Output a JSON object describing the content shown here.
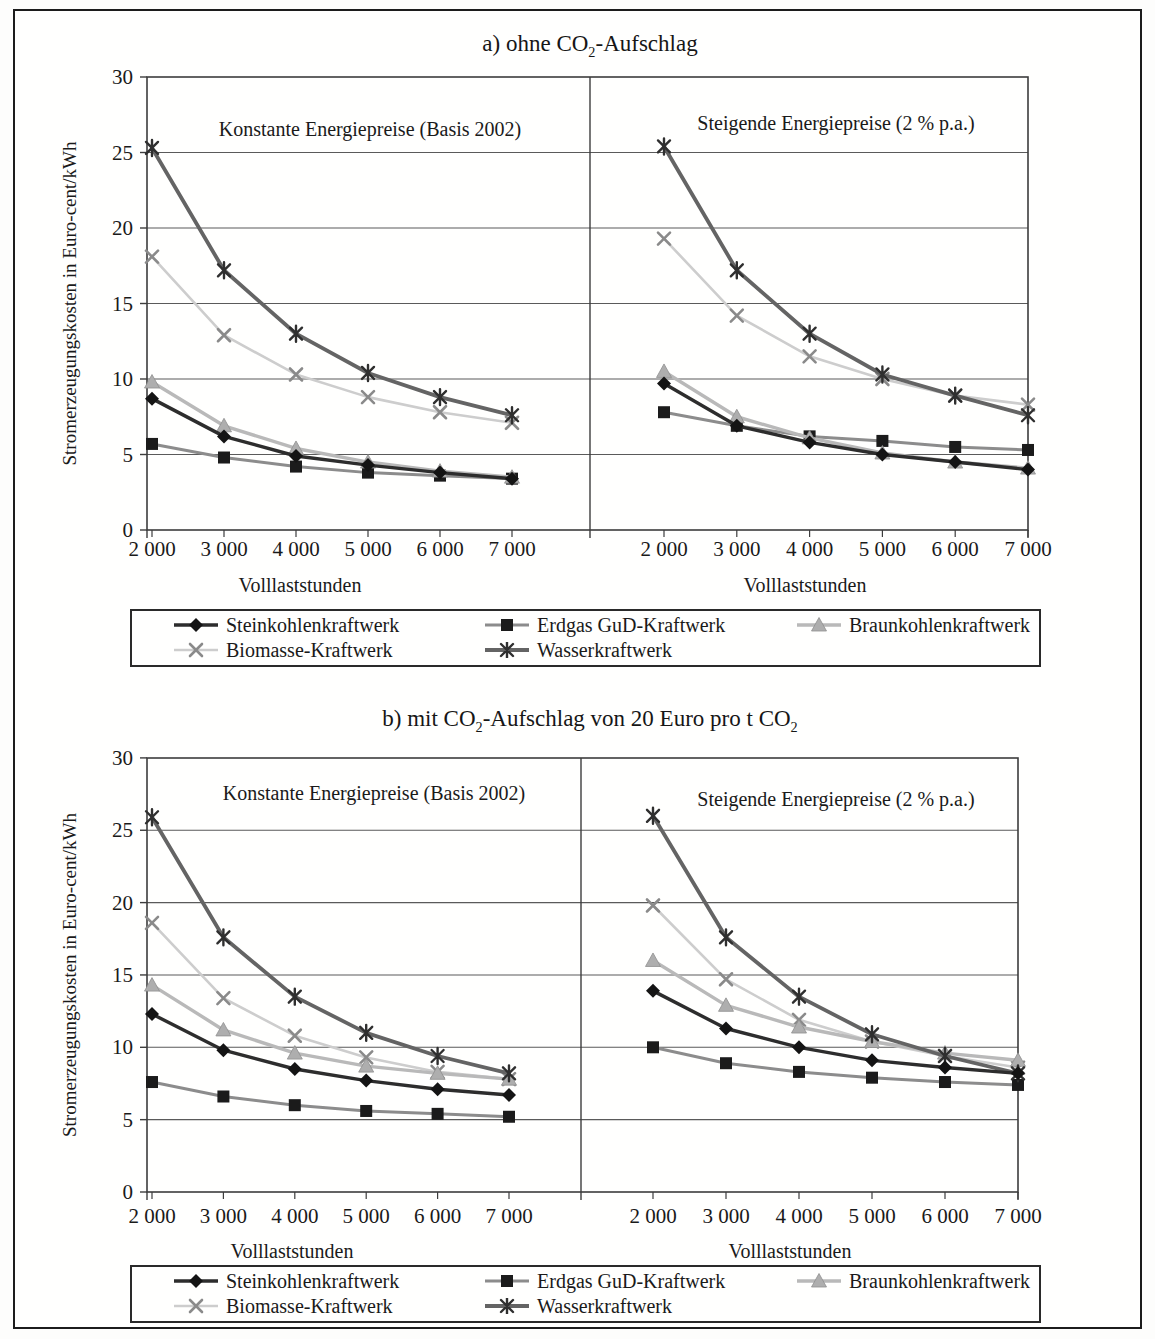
{
  "figure": {
    "background": "#fdfdfc",
    "border_color": "#1c1c1c",
    "grid_color": "#5a5a5a",
    "frame_color": "#3d3d3d",
    "text_color": "#1a1a1a"
  },
  "axes": {
    "ylabel": "Stromerzeugungskosten in Euro-cent/kWh",
    "xlabel": "Volllaststunden",
    "ylim": [
      0,
      30
    ],
    "yticks": [
      0,
      5,
      10,
      15,
      20,
      25,
      30
    ],
    "x": [
      2000,
      3000,
      4000,
      5000,
      6000,
      7000
    ],
    "x_tick_labels": [
      "2 000",
      "3 000",
      "4 000",
      "5 000",
      "6 000",
      "7 000"
    ],
    "grid": "horizontal"
  },
  "series_styles": [
    {
      "name": "Steinkohlenkraftwerk",
      "marker": "diamond",
      "line_color": "#2d2d2d",
      "marker_color": "#141414",
      "line_width": 3.4
    },
    {
      "name": "Erdgas GuD-Kraftwerk",
      "marker": "square",
      "line_color": "#8c8c8c",
      "marker_color": "#1b1b1b",
      "line_width": 3.0
    },
    {
      "name": "Braunkohlenkraftwerk",
      "marker": "triangle",
      "line_color": "#b9b9b9",
      "marker_color": "#aeaeae",
      "line_width": 3.4
    },
    {
      "name": "Biomasse-Kraftwerk",
      "marker": "x",
      "line_color": "#cdcdcd",
      "marker_color": "#8a8a8a",
      "line_width": 2.6
    },
    {
      "name": "Wasserkraftwerk",
      "marker": "asterisk",
      "line_color": "#646464",
      "marker_color": "#2f2f2f",
      "line_width": 3.8
    }
  ],
  "chart_data": [
    {
      "type": "line",
      "panel": "a",
      "title": "a) ohne CO₂-Aufschlag",
      "title_parts": [
        {
          "text": "a) ohne CO"
        },
        {
          "text": "2",
          "sub": true
        },
        {
          "text": "-Aufschlag"
        }
      ],
      "ylabel": "Stromerzeugungskosten in Euro-cent/kWh",
      "xlabel": "Volllaststunden",
      "x": [
        2000,
        3000,
        4000,
        5000,
        6000,
        7000
      ],
      "subcharts": [
        {
          "label": "Konstante Energiepreise (Basis 2002)",
          "series": [
            {
              "name": "Steinkohlenkraftwerk",
              "values": [
                8.7,
                6.2,
                4.9,
                4.3,
                3.8,
                3.4
              ]
            },
            {
              "name": "Erdgas GuD-Kraftwerk",
              "values": [
                5.7,
                4.8,
                4.2,
                3.8,
                3.6,
                3.4
              ]
            },
            {
              "name": "Braunkohlenkraftwerk",
              "values": [
                9.8,
                6.9,
                5.4,
                4.5,
                3.9,
                3.5
              ]
            },
            {
              "name": "Biomasse-Kraftwerk",
              "values": [
                18.1,
                12.9,
                10.3,
                8.8,
                7.8,
                7.1
              ]
            },
            {
              "name": "Wasserkraftwerk",
              "values": [
                25.3,
                17.2,
                13.0,
                10.4,
                8.8,
                7.6
              ]
            }
          ]
        },
        {
          "label": "Steigende Energiepreise (2 % p.a.)",
          "series": [
            {
              "name": "Steinkohlenkraftwerk",
              "values": [
                9.7,
                6.9,
                5.8,
                5.0,
                4.5,
                4.0
              ]
            },
            {
              "name": "Erdgas GuD-Kraftwerk",
              "values": [
                7.8,
                6.9,
                6.2,
                5.9,
                5.5,
                5.3
              ]
            },
            {
              "name": "Braunkohlenkraftwerk",
              "values": [
                10.5,
                7.5,
                6.1,
                5.1,
                4.5,
                4.1
              ]
            },
            {
              "name": "Biomasse-Kraftwerk",
              "values": [
                19.3,
                14.2,
                11.5,
                10.0,
                8.9,
                8.3
              ]
            },
            {
              "name": "Wasserkraftwerk",
              "values": [
                25.4,
                17.2,
                13.0,
                10.3,
                8.9,
                7.6
              ]
            }
          ]
        }
      ],
      "legend": [
        "Steinkohlenkraftwerk",
        "Erdgas GuD-Kraftwerk",
        "Braunkohlenkraftwerk",
        "Biomasse-Kraftwerk",
        "Wasserkraftwerk"
      ]
    },
    {
      "type": "line",
      "panel": "b",
      "title": "b) mit CO₂-Aufschlag von 20 Euro pro t CO₂",
      "title_parts": [
        {
          "text": "b) mit CO"
        },
        {
          "text": "2",
          "sub": true
        },
        {
          "text": "-Aufschlag von 20 Euro pro t CO"
        },
        {
          "text": "2",
          "sub": true
        }
      ],
      "ylabel": "Stromerzeugungskosten in Euro-cent/kWh",
      "xlabel": "Volllaststunden",
      "x": [
        2000,
        3000,
        4000,
        5000,
        6000,
        7000
      ],
      "subcharts": [
        {
          "label": "Konstante Energiepreise (Basis 2002)",
          "series": [
            {
              "name": "Steinkohlenkraftwerk",
              "values": [
                12.3,
                9.8,
                8.5,
                7.7,
                7.1,
                6.7
              ]
            },
            {
              "name": "Erdgas GuD-Kraftwerk",
              "values": [
                7.6,
                6.6,
                6.0,
                5.6,
                5.4,
                5.2
              ]
            },
            {
              "name": "Braunkohlenkraftwerk",
              "values": [
                14.3,
                11.2,
                9.6,
                8.7,
                8.2,
                7.8
              ]
            },
            {
              "name": "Biomasse-Kraftwerk",
              "values": [
                18.6,
                13.4,
                10.8,
                9.3,
                8.3,
                7.8
              ]
            },
            {
              "name": "Wasserkraftwerk",
              "values": [
                25.9,
                17.6,
                13.5,
                11.0,
                9.4,
                8.2
              ]
            }
          ]
        },
        {
          "label": "Steigende Energiepreise (2 % p.a.)",
          "series": [
            {
              "name": "Steinkohlenkraftwerk",
              "values": [
                13.9,
                11.3,
                10.0,
                9.1,
                8.6,
                8.2
              ]
            },
            {
              "name": "Erdgas GuD-Kraftwerk",
              "values": [
                10.0,
                8.9,
                8.3,
                7.9,
                7.6,
                7.4
              ]
            },
            {
              "name": "Braunkohlenkraftwerk",
              "values": [
                16.0,
                12.9,
                11.4,
                10.4,
                9.6,
                9.1
              ]
            },
            {
              "name": "Biomasse-Kraftwerk",
              "values": [
                19.8,
                14.7,
                11.9,
                10.4,
                9.4,
                8.6
              ]
            },
            {
              "name": "Wasserkraftwerk",
              "values": [
                26.0,
                17.6,
                13.5,
                10.9,
                9.4,
                8.2
              ]
            }
          ]
        }
      ],
      "legend": [
        "Steinkohlenkraftwerk",
        "Erdgas GuD-Kraftwerk",
        "Braunkohlenkraftwerk",
        "Biomasse-Kraftwerk",
        "Wasserkraftwerk"
      ]
    }
  ]
}
